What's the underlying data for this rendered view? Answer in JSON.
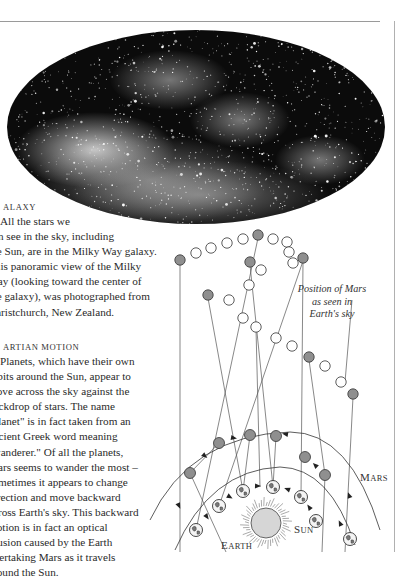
{
  "page": {
    "rules": {
      "color": "#9a9a9a"
    }
  },
  "galaxy_photo": {
    "subject": "Milky Way panoramic photograph",
    "shape": "ellipse",
    "bg_color": "#0b0b0b"
  },
  "galaxy_section": {
    "heading": "ALAXY",
    "lines": [
      "All the stars we",
      "can see in the sky, including",
      "the Sun, are in the Milky Way galaxy.",
      "This panoramic view of the Milky",
      "Way (looking toward the center of",
      "the galaxy), was photographed from",
      "Christchurch, New Zealand."
    ]
  },
  "martian_section": {
    "heading": "ARTIAN MOTION",
    "lines": [
      "Planets, which have their own",
      "orbits around the Sun, appear to",
      "move across the sky against the",
      "backdrop of stars. The name",
      "\"planet\" is in fact taken from an",
      "ancient Greek word meaning",
      "\"wanderer.\" Of all the planets,",
      "Mars seems to wander the most –",
      "sometimes it appears to change",
      "direction and move backward",
      "across Earth's sky. This backward",
      "motion is in fact an optical",
      "illusion caused by the Earth",
      "overtaking Mars as it travels",
      "around the Sun."
    ]
  },
  "diagram": {
    "caption": [
      "Position of Mars",
      "as seen in",
      "Earth's sky"
    ],
    "labels": {
      "earth": "Earth",
      "sun": "Sun",
      "mars": "Mars"
    },
    "colors": {
      "mars_fill": "#8f8f8f",
      "sky_hollow": "#ffffff",
      "line": "#555555",
      "sun_fill": "#d6d6d6"
    }
  }
}
